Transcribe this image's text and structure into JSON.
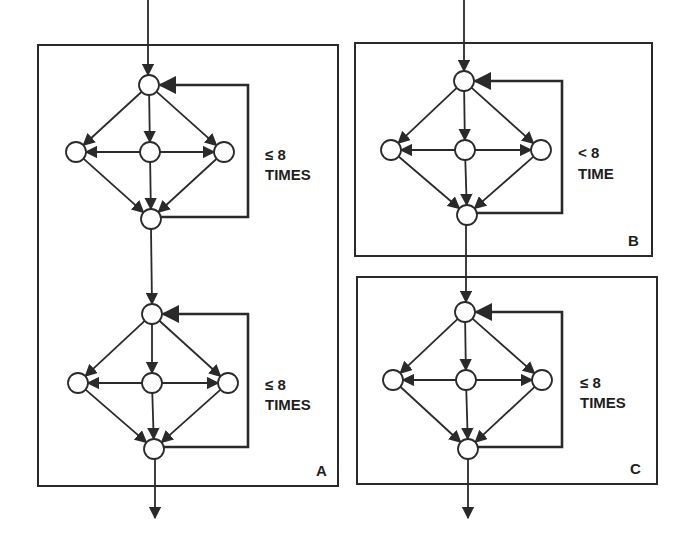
{
  "figure": {
    "width": 691,
    "height": 538,
    "stroke_color": "#2a2a2a",
    "background": "#ffffff"
  },
  "panels": [
    {
      "id": "A",
      "label": "A",
      "box": {
        "x1": 38,
        "y1": 45,
        "x2": 338,
        "y2": 486
      },
      "label_pos": {
        "x": 316,
        "y": 476
      },
      "entry": {
        "x": 148,
        "y_start": 0,
        "y_end": 75
      },
      "exit": {
        "x": 155,
        "y_start": 459,
        "y_end": 518
      },
      "stages": [
        {
          "nodes": {
            "top": [
              149,
              85
            ],
            "left": [
              76,
              152
            ],
            "center": [
              150,
              152
            ],
            "right": [
              224,
              152
            ],
            "bottom": [
              151,
              219
            ]
          },
          "loop_x": 248,
          "loop_text": [
            "≤ 8",
            "TIMES"
          ],
          "loop_text_pos": {
            "x": 265,
            "y1": 160,
            "y2": 180
          }
        },
        {
          "nodes": {
            "top": [
              152,
              314
            ],
            "left": [
              78,
              383
            ],
            "center": [
              152,
              383
            ],
            "right": [
              228,
              383
            ],
            "bottom": [
              154,
              449
            ]
          },
          "loop_x": 248,
          "loop_text": [
            "≤ 8",
            "TIMES"
          ],
          "loop_text_pos": {
            "x": 265,
            "y1": 390,
            "y2": 410
          }
        }
      ]
    },
    {
      "id": "B",
      "label": "B",
      "box": {
        "x1": 355,
        "y1": 43,
        "x2": 652,
        "y2": 256
      },
      "label_pos": {
        "x": 628,
        "y": 246
      },
      "entry": {
        "x": 464,
        "y_start": 0,
        "y_end": 71
      },
      "exit": null,
      "stages": [
        {
          "nodes": {
            "top": [
              464,
              81
            ],
            "left": [
              391,
              150
            ],
            "center": [
              465,
              150
            ],
            "right": [
              541,
              150
            ],
            "bottom": [
              467,
              215
            ]
          },
          "loop_x": 562,
          "loop_text": [
            "< 8",
            "TIME"
          ],
          "loop_text_pos": {
            "x": 578,
            "y1": 158,
            "y2": 179
          }
        }
      ]
    },
    {
      "id": "C",
      "label": "C",
      "box": {
        "x1": 357,
        "y1": 277,
        "x2": 657,
        "y2": 484
      },
      "label_pos": {
        "x": 630,
        "y": 474
      },
      "entry": {
        "x": 466,
        "y_start": 225,
        "y_end": 302
      },
      "exit": {
        "x": 468,
        "y_start": 459,
        "y_end": 518
      },
      "stages": [
        {
          "nodes": {
            "top": [
              465,
              312
            ],
            "left": [
              393,
              380
            ],
            "center": [
              466,
              380
            ],
            "right": [
              542,
              380
            ],
            "bottom": [
              468,
              449
            ]
          },
          "loop_x": 562,
          "loop_text": [
            "≤ 8",
            "TIMES"
          ],
          "loop_text_pos": {
            "x": 580,
            "y1": 388,
            "y2": 408
          }
        }
      ]
    }
  ],
  "inter_stage_links": [
    {
      "panel": "A",
      "from": [
        151,
        229
      ],
      "to": [
        152,
        304
      ]
    }
  ],
  "node_radius": 10,
  "legend_text": {
    "A_loop_1": "≤ 8 TIMES",
    "A_loop_2": "≤ 8 TIMES",
    "B_loop": "< 8 TIME",
    "C_loop": "≤ 8 TIMES"
  }
}
